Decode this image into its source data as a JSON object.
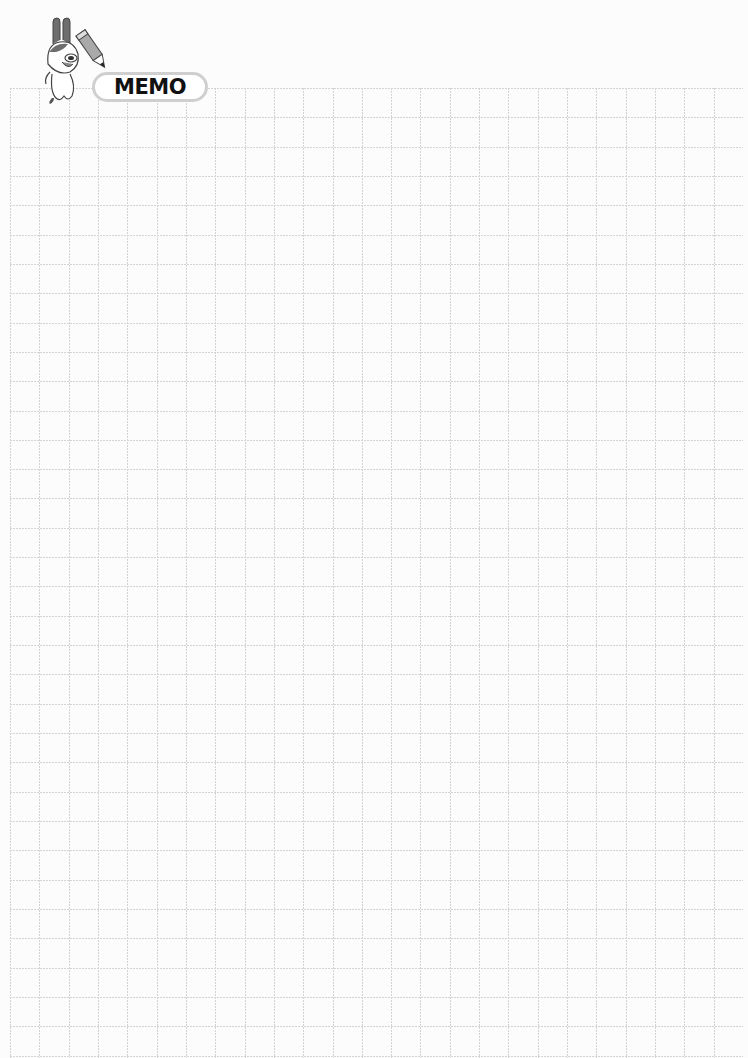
{
  "header": {
    "badge_label": "MEMO",
    "mascot": "rabbit-with-pencil-icon"
  },
  "grid": {
    "left": 10,
    "top": 88,
    "cell_size": 29.32,
    "columns": 25,
    "rows": 33,
    "line_color": "#d4d4d4",
    "line_style": "dashed"
  },
  "colors": {
    "background": "#fcfcfc",
    "badge_border": "#cfcfcf",
    "text": "#111111",
    "mascot_gray": "#6e6e6e",
    "pencil_fill": "#a9a9a9"
  }
}
